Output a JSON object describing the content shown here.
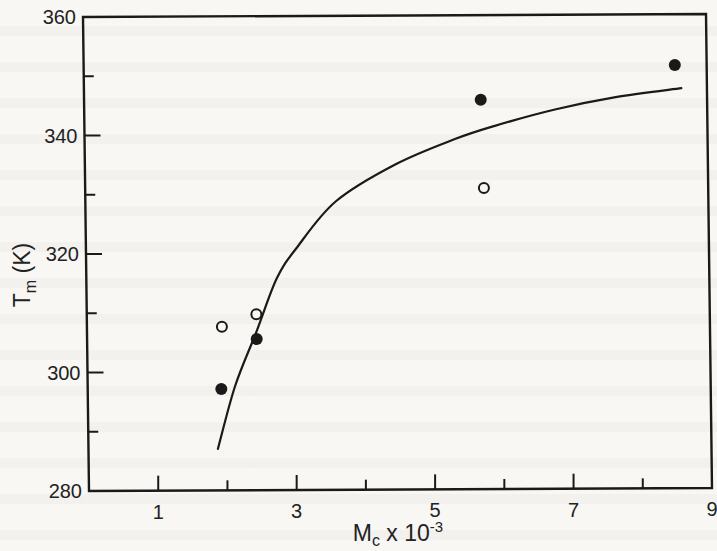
{
  "chart_data": {
    "type": "scatter",
    "title": "",
    "xlabel": "M_c x 10^-3",
    "xlabel_parts": {
      "main": "M",
      "sub": "c",
      "rest": " x 10",
      "sup": "-3"
    },
    "ylabel": "T_m (K)",
    "ylabel_parts": {
      "main": "T",
      "sub": "m",
      "rest": " (K)"
    },
    "xlim": [
      0,
      9
    ],
    "ylim": [
      280,
      360
    ],
    "x_ticks_labeled": [
      1,
      3,
      5,
      7,
      9
    ],
    "x_ticks_minor": [
      2,
      4,
      6,
      8
    ],
    "x_tick_labels": [
      "1",
      "3",
      "5",
      "7",
      "9"
    ],
    "y_ticks_labeled": [
      280,
      300,
      320,
      340,
      360
    ],
    "y_ticks_minor": [
      290,
      310,
      330,
      350
    ],
    "y_tick_labels": [
      "280",
      "300",
      "320",
      "340",
      "360"
    ],
    "grid": false,
    "legend": null,
    "series": [
      {
        "name": "filled circles",
        "marker": "filled-circle",
        "color": "#1a1a1a",
        "points": [
          {
            "x": 1.93,
            "y": 297.1
          },
          {
            "x": 2.45,
            "y": 305.5
          },
          {
            "x": 5.73,
            "y": 345.7
          },
          {
            "x": 8.54,
            "y": 351.4
          }
        ]
      },
      {
        "name": "open circles",
        "marker": "open-circle",
        "color": "#1a1a1a",
        "points": [
          {
            "x": 1.95,
            "y": 307.6
          },
          {
            "x": 2.45,
            "y": 309.7
          },
          {
            "x": 5.76,
            "y": 330.8
          }
        ]
      },
      {
        "name": "fitted curve",
        "marker": "line",
        "color": "#1a1a1a",
        "points": [
          {
            "x": 1.87,
            "y": 287.0
          },
          {
            "x": 2.13,
            "y": 297.6
          },
          {
            "x": 2.45,
            "y": 306.8
          },
          {
            "x": 2.75,
            "y": 315.7
          },
          {
            "x": 3.04,
            "y": 320.8
          },
          {
            "x": 3.62,
            "y": 328.7
          },
          {
            "x": 4.49,
            "y": 334.9
          },
          {
            "x": 5.35,
            "y": 339.1
          },
          {
            "x": 5.93,
            "y": 341.3
          },
          {
            "x": 6.8,
            "y": 344.0
          },
          {
            "x": 7.66,
            "y": 346.0
          },
          {
            "x": 8.63,
            "y": 347.5
          }
        ]
      }
    ]
  }
}
